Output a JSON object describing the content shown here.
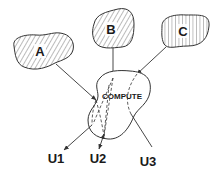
{
  "diagram": {
    "sources": [
      {
        "id": "A",
        "label": "A",
        "hatch": "diagonal-right"
      },
      {
        "id": "B",
        "label": "B",
        "hatch": "diagonal-right"
      },
      {
        "id": "C",
        "label": "C",
        "hatch": "vertical"
      }
    ],
    "center": {
      "id": "compute",
      "label": "COMPUTE"
    },
    "outputs": [
      {
        "id": "U1",
        "label": "U1"
      },
      {
        "id": "U2",
        "label": "U2"
      },
      {
        "id": "U3",
        "label": "U3"
      }
    ],
    "edges": [
      {
        "from": "A",
        "to": "compute",
        "style": "solid"
      },
      {
        "from": "B",
        "to": "compute",
        "style": "solid"
      },
      {
        "from": "C",
        "to": "compute",
        "style": "solid"
      },
      {
        "from": "compute",
        "to": "U1",
        "style": "solid-with-dashed-inside"
      },
      {
        "from": "compute",
        "to": "U2",
        "style": "solid-with-dashed-inside"
      },
      {
        "from": "compute",
        "to": "U3",
        "style": "solid-with-dashed-inside"
      }
    ],
    "colors": {
      "stroke": "#333333",
      "background": "#ffffff"
    }
  }
}
